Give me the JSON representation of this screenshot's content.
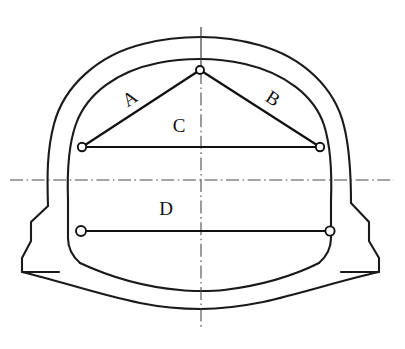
{
  "diagram": {
    "type": "engineering-cross-section",
    "background_color": "#ffffff",
    "line_color": "#1a1a1a",
    "centerline_color": "#4a4a4a",
    "node_fill_color": "#ffffff"
  },
  "labels": {
    "chord_a": "A",
    "chord_b": "B",
    "chord_c": "C",
    "chord_d": "D"
  },
  "measurement_lines": [
    {
      "id": "A",
      "label": "A",
      "description": "crown-to-left-spring inclined chord",
      "from": {
        "x": 200,
        "y": 70
      },
      "to": {
        "x": 82,
        "y": 147
      },
      "label_pos": {
        "x": 131,
        "y": 100
      },
      "label_rotation": -33
    },
    {
      "id": "B",
      "label": "B",
      "description": "crown-to-right-spring inclined chord",
      "from": {
        "x": 200,
        "y": 70
      },
      "to": {
        "x": 320,
        "y": 147
      },
      "label_pos": {
        "x": 272,
        "y": 100
      },
      "label_rotation": 33
    },
    {
      "id": "C",
      "label": "C",
      "description": "upper horizontal convergence chord at spring line",
      "from": {
        "x": 82,
        "y": 147
      },
      "to": {
        "x": 320,
        "y": 147
      },
      "label_pos": {
        "x": 179,
        "y": 128
      },
      "label_rotation": 0
    },
    {
      "id": "D",
      "label": "D",
      "description": "lower horizontal convergence chord above invert",
      "from": {
        "x": 81,
        "y": 231
      },
      "to": {
        "x": 330,
        "y": 231
      },
      "label_pos": {
        "x": 166,
        "y": 211
      },
      "label_rotation": 0
    }
  ],
  "nodes": [
    {
      "id": "crown",
      "x": 200,
      "y": 70,
      "r": 4.0,
      "description": "crown reference point"
    },
    {
      "id": "left-spring",
      "x": 82,
      "y": 147,
      "r": 4.2,
      "description": "left spring line reference point"
    },
    {
      "id": "right-spring",
      "x": 320,
      "y": 147,
      "r": 4.2,
      "description": "right spring line reference point"
    },
    {
      "id": "left-lower",
      "x": 81,
      "y": 231,
      "r": 5.0,
      "description": "left lower reference point"
    },
    {
      "id": "right-lower",
      "x": 330,
      "y": 231,
      "r": 4.6,
      "description": "right lower reference point"
    }
  ],
  "centerlines": {
    "vertical_label": "vertical axis of symmetry",
    "horizontal_label": "horizontal spring-level axis",
    "vertical_x": 201,
    "horizontal_y": 180
  },
  "geometry": {
    "outer_profile": "M 57,285 L 57,233 L 40,212 L 40,196 L 52,185 L 56,160 C 58,108 106,48 177,41 C 186,40 194,40 201,40 C 272,41 330,82 340,150 C 343,168 344,182 345,196 L 356,203 L 366,212 L 366,236 L 366,264 L 311,264 C 289,286 253,299 203,300 C 150,300 110,288 83,266 L 57,285 Z",
    "inner_profile": "M 83,240 L 83,196 L 83,170 C 83,120 126,72 201,69 C 274,72 317,120 317,170 L 317,196 L 317,246 C 317,252 318,258 320,262 C 280,281 244,288 203,288 C 160,288 122,280 86,262 C 85,254 83,247 83,240 Z"
  }
}
